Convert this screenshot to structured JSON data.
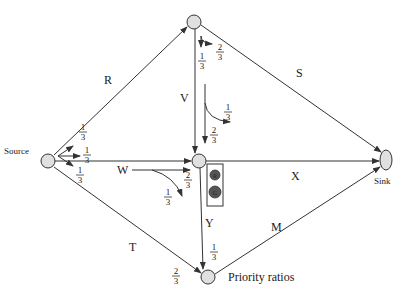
{
  "nodes": {
    "source": {
      "label": "Source"
    },
    "sink": {
      "label": "Sink"
    },
    "top": {
      "label": ""
    },
    "middle": {
      "label": ""
    },
    "bottom": {
      "label": "Priority ratios"
    }
  },
  "edges": {
    "R": {
      "label": "R",
      "from": "source",
      "to": "top"
    },
    "S": {
      "label": "S",
      "from": "top",
      "to": "sink"
    },
    "V": {
      "label": "V",
      "from": "top",
      "to": "middle"
    },
    "W": {
      "label": "W",
      "from": "source",
      "to": "middle"
    },
    "X": {
      "label": "X",
      "from": "middle",
      "to": "sink"
    },
    "T": {
      "label": "T",
      "from": "source",
      "to": "bottom"
    },
    "Y": {
      "label": "Y",
      "from": "middle",
      "to": "bottom"
    },
    "M": {
      "label": "M",
      "from": "bottom",
      "to": "sink"
    }
  },
  "ratios": {
    "source_R": {
      "num": "1",
      "den": "3"
    },
    "source_W": {
      "num": "1",
      "den": "3"
    },
    "source_T": {
      "num": "1",
      "den": "3"
    },
    "top_V": {
      "num": "1",
      "den": "3"
    },
    "top_S": {
      "num": "2",
      "den": "3"
    },
    "V_turn": {
      "num": "1",
      "den": "3"
    },
    "V_straight": {
      "num": "2",
      "den": "3"
    },
    "W_straight": {
      "num": "2",
      "den": "3"
    },
    "W_turn": {
      "num": "1",
      "den": "3"
    },
    "Y_ratio": {
      "num": "1",
      "den": "3"
    },
    "T_ratio": {
      "num": "2",
      "den": "3"
    }
  },
  "traffic_light": {
    "red_label": "R",
    "green_label": "G"
  },
  "colors": {
    "node_fill": "#e0e0e0",
    "stroke": "#333333",
    "light_fill": "#555555"
  }
}
